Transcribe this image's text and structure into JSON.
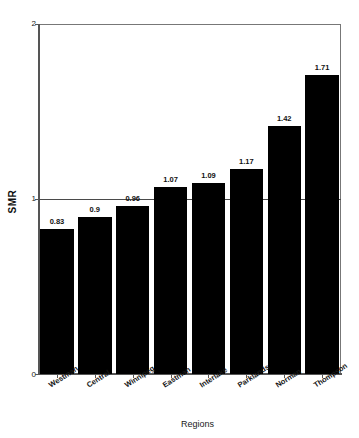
{
  "figure": {
    "title_remnant": "",
    "xaxis_title": "Regions",
    "yaxis_title": "SMR",
    "ytick_labels": [
      "0",
      "1",
      "2"
    ]
  },
  "chart_data": {
    "type": "bar",
    "title": "",
    "xlabel": "Regions",
    "ylabel": "SMR",
    "ylim": [
      0,
      2
    ],
    "yticks": [
      0,
      1,
      2
    ],
    "grid": false,
    "legend": "none",
    "reference_line": 1,
    "bar_color": "#000000",
    "value_labels": true,
    "categories": [
      "Westman",
      "Central",
      "Winnipeg",
      "Eastman",
      "Interlake",
      "Parklands",
      "Norman",
      "Thompson"
    ],
    "values": [
      0.83,
      0.9,
      0.96,
      1.07,
      1.09,
      1.17,
      1.42,
      1.71
    ],
    "value_label_text": [
      "0.83",
      "0.9",
      "0.96",
      "1.07",
      "1.09",
      "1.17",
      "1.42",
      "1.71"
    ]
  }
}
